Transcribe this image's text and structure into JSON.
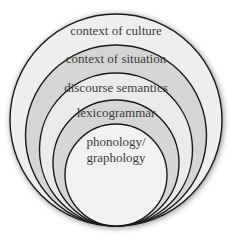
{
  "diagram": {
    "type": "nested-circles",
    "layers": [
      {
        "label": "context of culture",
        "top": 14,
        "radius": 106,
        "fill": "#eeeeee",
        "label_y": 30
      },
      {
        "label": "context of situation",
        "top": 45,
        "radius": 90.5,
        "fill": "#d5d5d5",
        "label_y": 58
      },
      {
        "label": "discourse semantics",
        "top": 73,
        "radius": 76.5,
        "fill": "#ebebeb",
        "label_y": 87
      },
      {
        "label": "lexicogrammar",
        "top": 100,
        "radius": 63,
        "fill": "#d6d6d6",
        "label_y": 112
      },
      {
        "label": "phonology/",
        "label_line2": "graphology",
        "top": 124,
        "radius": 51,
        "fill": "#f1f1f1",
        "label_y": 141
      }
    ],
    "colors": {
      "stroke": "#1a1a1a",
      "text": "#3a3a3a",
      "shadow": "#9a9a9a"
    }
  }
}
